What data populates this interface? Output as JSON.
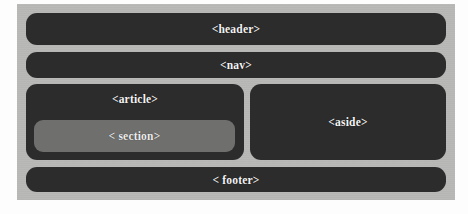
{
  "diagram": {
    "background_color": "#fdfdfd",
    "page_background_color": "#b9b9b8",
    "block_color": "#2c2c2c",
    "nested_block_color": "#6f6f6e",
    "label_color": "#f4f4f4",
    "blocks": [
      {
        "id": "header",
        "label": "<header>",
        "row": 1,
        "span": "full"
      },
      {
        "id": "nav",
        "label": "<nav>",
        "row": 2,
        "span": "full"
      },
      {
        "id": "article",
        "label": "<article>",
        "row": 3,
        "span": "left-column"
      },
      {
        "id": "section",
        "label": "< section>",
        "row": 3,
        "span": "nested-in-article"
      },
      {
        "id": "aside",
        "label": "<aside>",
        "row": 3,
        "span": "right-column"
      },
      {
        "id": "footer",
        "label": "< footer>",
        "row": 4,
        "span": "full"
      }
    ]
  }
}
